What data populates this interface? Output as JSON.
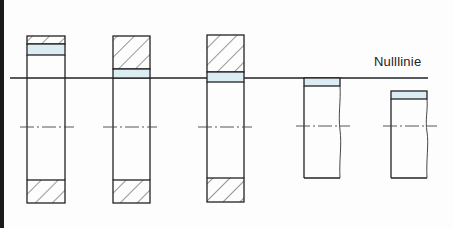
{
  "diagram": {
    "zero_line_label": "Nulllinie",
    "colors": {
      "line": "#222222",
      "tolerance_band": "#dcecf3",
      "hatch": "#333333",
      "background": "#fdfdfd"
    },
    "parts": [
      {
        "name": "bore-1",
        "type": "bore",
        "tolerance_position": "above zero line"
      },
      {
        "name": "bore-2",
        "type": "bore",
        "tolerance_position": "just above zero line"
      },
      {
        "name": "bore-3",
        "type": "bore",
        "tolerance_position": "straddling zero line"
      },
      {
        "name": "shaft-1",
        "type": "shaft",
        "tolerance_position": "just below zero line"
      },
      {
        "name": "shaft-2",
        "type": "shaft",
        "tolerance_position": "below zero line"
      }
    ]
  }
}
